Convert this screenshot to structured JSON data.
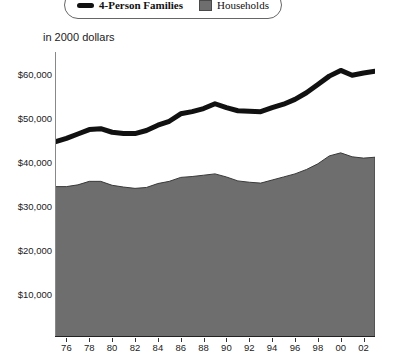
{
  "legend": {
    "position": "top",
    "entries": [
      {
        "label": "4-Person Families",
        "marker": "thick-black-line",
        "color": "#111111",
        "style": "bold"
      },
      {
        "label": "Households",
        "marker": "gray-filled-square",
        "color": "#6e6e6e",
        "style": "plain"
      }
    ]
  },
  "annotation": {
    "units_note": "in 2000 dollars"
  },
  "axis": {
    "y_ticks": [
      "$10,000",
      "$20,000",
      "$30,000",
      "$40,000",
      "$50,000",
      "$60,000"
    ],
    "x_ticks": [
      "76",
      "78",
      "80",
      "82",
      "84",
      "86",
      "88",
      "90",
      "92",
      "94",
      "96",
      "98",
      "00",
      "02"
    ]
  },
  "colors": {
    "families_line": "#111111",
    "households_area": "#6e6e6e",
    "households_edge": "#3a3a3a",
    "axis": "#222222",
    "background": "#ffffff"
  },
  "chart_data": {
    "type": "line",
    "title": "",
    "subtitle": "",
    "xlabel": "",
    "ylabel": "",
    "annotation": "in 2000 dollars",
    "grid": false,
    "legend_position": "top",
    "xlim": [
      1975,
      2003
    ],
    "ylim": [
      0,
      65000
    ],
    "y_tick_values": [
      10000,
      20000,
      30000,
      40000,
      50000,
      60000
    ],
    "y_tick_labels": [
      "$10,000",
      "$20,000",
      "$30,000",
      "$40,000",
      "$50,000",
      "$60,000"
    ],
    "x_tick_values": [
      1976,
      1978,
      1980,
      1982,
      1984,
      1986,
      1988,
      1990,
      1992,
      1994,
      1996,
      1998,
      2000,
      2002
    ],
    "x_tick_labels": [
      "76",
      "78",
      "80",
      "82",
      "84",
      "86",
      "88",
      "90",
      "92",
      "94",
      "96",
      "98",
      "00",
      "02"
    ],
    "x": [
      1975,
      1976,
      1977,
      1978,
      1979,
      1980,
      1981,
      1982,
      1983,
      1984,
      1985,
      1986,
      1987,
      1988,
      1989,
      1990,
      1991,
      1992,
      1993,
      1994,
      1995,
      1996,
      1997,
      1998,
      1999,
      2000,
      2001,
      2002,
      2003
    ],
    "series": [
      {
        "name": "4-Person Families",
        "render": "line",
        "color": "#111111",
        "line_width_px": 5,
        "values": [
          44500,
          45300,
          46300,
          47300,
          47500,
          46700,
          46400,
          46400,
          47100,
          48300,
          49200,
          50900,
          51400,
          52100,
          53200,
          52300,
          51600,
          51500,
          51400,
          52300,
          53100,
          54200,
          55700,
          57600,
          59500,
          60800,
          59700,
          60200,
          60600
        ]
      },
      {
        "name": "Households",
        "render": "area",
        "color": "#6e6e6e",
        "values": [
          34300,
          34300,
          34700,
          35500,
          35500,
          34600,
          34200,
          33900,
          34100,
          35000,
          35500,
          36400,
          36600,
          36900,
          37200,
          36500,
          35600,
          35300,
          35100,
          35800,
          36500,
          37200,
          38200,
          39500,
          41300,
          42000,
          41100,
          40800,
          41000
        ]
      }
    ]
  }
}
